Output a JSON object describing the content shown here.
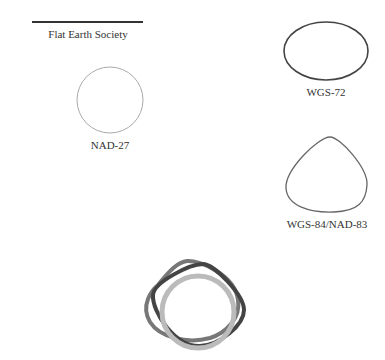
{
  "shapes": [
    {
      "id": "flat",
      "label": "Flat Earth Society",
      "stroke": "#333333"
    },
    {
      "id": "nad27",
      "label": "NAD-27",
      "stroke": "#aaaaaa"
    },
    {
      "id": "wgs72",
      "label": "WGS-72",
      "stroke": "#444444"
    },
    {
      "id": "wgs84",
      "label": "WGS-84/NAD-83",
      "stroke": "#666666"
    }
  ],
  "overlay": {
    "description": "Overlay of NAD-27, WGS-72 and WGS-84/NAD-83 shapes",
    "colors": [
      "#bbbbbb",
      "#444444",
      "#777777"
    ]
  }
}
